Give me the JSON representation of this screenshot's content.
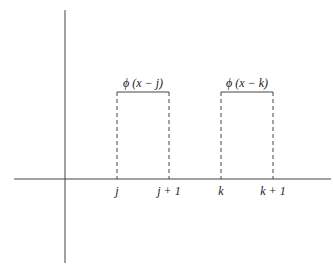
{
  "diagram": {
    "title": "",
    "functions": [
      {
        "label": "ϕ (x − j)",
        "left_tick": "j",
        "right_tick": "j + 1"
      },
      {
        "label": "ϕ (x − k)",
        "left_tick": "k",
        "right_tick": "k + 1"
      }
    ],
    "colors": {
      "line": "#444444",
      "text": "#222222"
    }
  }
}
